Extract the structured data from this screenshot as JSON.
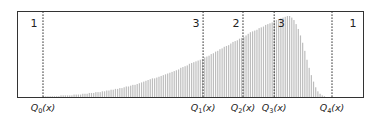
{
  "chart_data": {
    "type": "bar",
    "title": "",
    "xlabel": "",
    "ylabel": "",
    "grid": false,
    "quantiles": [
      {
        "label": "Q",
        "sub": "0",
        "suffix": "(x)",
        "pos": 0.0
      },
      {
        "label": "Q",
        "sub": "1",
        "suffix": "(x)",
        "pos": 0.554
      },
      {
        "label": "Q",
        "sub": "2",
        "suffix": "(x)",
        "pos": 0.692
      },
      {
        "label": "Q",
        "sub": "3",
        "suffix": "(x)",
        "pos": 0.8
      },
      {
        "label": "Q",
        "sub": "4",
        "suffix": "(x)",
        "pos": 1.0
      }
    ],
    "region_labels": [
      {
        "text": "1",
        "anchor": "left-of-Q0"
      },
      {
        "text": "3",
        "anchor": "left-of-Q1"
      },
      {
        "text": "2",
        "anchor": "left-of-Q2"
      },
      {
        "text": "3",
        "anchor": "right-of-Q3"
      },
      {
        "text": "1",
        "anchor": "right-of-Q4"
      }
    ],
    "values": [
      1,
      1,
      1,
      1,
      1,
      1,
      1,
      1,
      2,
      2,
      2,
      2,
      2,
      2,
      3,
      3,
      3,
      3,
      4,
      4,
      4,
      5,
      5,
      5,
      6,
      6,
      6,
      7,
      7,
      8,
      8,
      9,
      9,
      10,
      10,
      11,
      11,
      12,
      13,
      13,
      14,
      15,
      15,
      16,
      17,
      18,
      19,
      20,
      21,
      22,
      23,
      23,
      24,
      25,
      26,
      27,
      28,
      29,
      30,
      31,
      32,
      33,
      34,
      36,
      37,
      38,
      39,
      41,
      42,
      43,
      44,
      45,
      46,
      47,
      49,
      50,
      51,
      53,
      54,
      56,
      57,
      59,
      60,
      62,
      63,
      64,
      66,
      68,
      69,
      70,
      72,
      73,
      74,
      76,
      78,
      80,
      81,
      82,
      83,
      85,
      86,
      87,
      89,
      90,
      91,
      92,
      93,
      95,
      96,
      97,
      98,
      99,
      100,
      100,
      98,
      95,
      90,
      84,
      76,
      67,
      57,
      46,
      36,
      27,
      19,
      12,
      7,
      4,
      2,
      1
    ]
  }
}
